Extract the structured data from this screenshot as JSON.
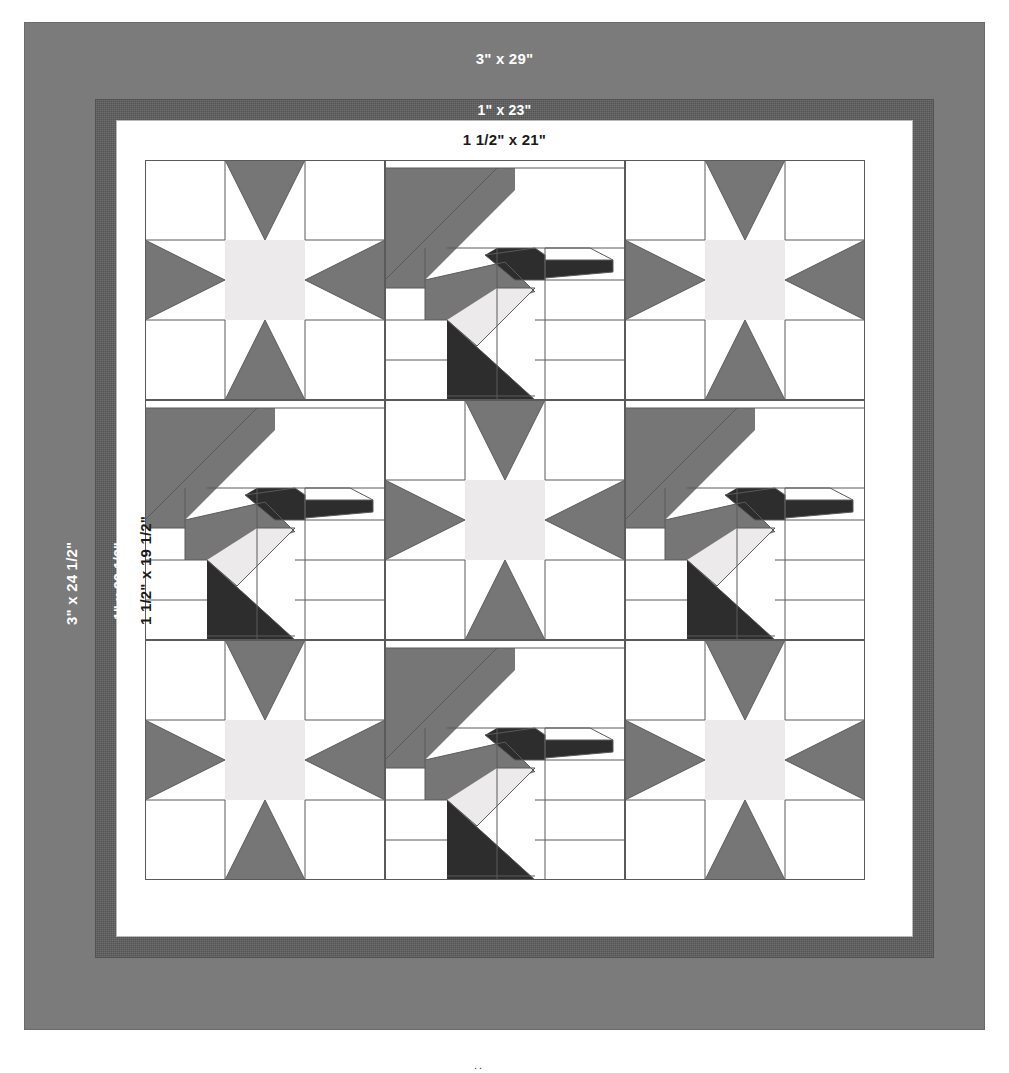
{
  "diagram": {
    "colors": {
      "outer_border": "#7b7b7b",
      "middle_border": "#5e5e5e",
      "inner_border": "#ffffff",
      "background": "#ffffff",
      "star_points": "#767676",
      "star_center": "#eceaea",
      "bird_wing": "#767676",
      "bird_body": "#2d2d2d",
      "bird_beak_stripe": "#eceaea",
      "seam_line": "#5a5a5a"
    },
    "borders": {
      "top_outer_label": "3\" x 29\"",
      "top_middle_label": "1\" x 23\"",
      "top_inner_label": "1 1/2\" x 21\"",
      "left_outer_label": "3\" x 24 1/2\"",
      "left_middle_label": "1\" x 22 1/2\"",
      "left_inner_label": "1 1/2\" x 19 1/2\""
    },
    "layout": {
      "rows": 3,
      "columns": 3,
      "blocks": [
        {
          "position": "row1-col1",
          "type": "star"
        },
        {
          "position": "row1-col2",
          "type": "bird"
        },
        {
          "position": "row1-col3",
          "type": "star"
        },
        {
          "position": "row2-col1",
          "type": "bird"
        },
        {
          "position": "row2-col2",
          "type": "star"
        },
        {
          "position": "row2-col3",
          "type": "bird"
        },
        {
          "position": "row3-col1",
          "type": "star"
        },
        {
          "position": "row3-col2",
          "type": "bird"
        },
        {
          "position": "row3-col3",
          "type": "star"
        }
      ]
    },
    "bottom_mark": ".."
  }
}
